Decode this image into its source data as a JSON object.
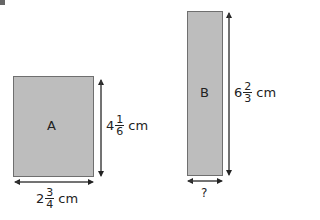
{
  "shapes": {
    "A": {
      "label": "A",
      "fill": "#bdbdbd"
    },
    "B": {
      "label": "B",
      "fill": "#bdbdbd"
    }
  },
  "dimensions": {
    "A_height": {
      "whole": "4",
      "numerator": "1",
      "denominator": "6",
      "unit": "cm"
    },
    "A_width": {
      "whole": "2",
      "numerator": "3",
      "denominator": "4",
      "unit": "cm"
    },
    "B_height": {
      "whole": "6",
      "numerator": "2",
      "denominator": "3",
      "unit": "cm"
    },
    "B_width": {
      "unknown": "?"
    }
  }
}
